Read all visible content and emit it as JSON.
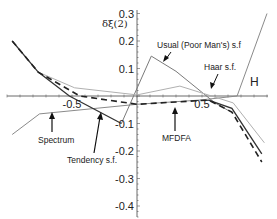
{
  "chart_data": {
    "type": "line",
    "title": "",
    "xlabel": "H",
    "ylabel": "δξ(2)",
    "xlim": [
      -1.0,
      1.0
    ],
    "ylim": [
      -0.45,
      0.3
    ],
    "xticks": [
      -0.5,
      0.5
    ],
    "xtick_labels": [
      "-0.5",
      "0.5"
    ],
    "yticks": [
      0.3,
      0.2,
      0.1,
      -0.1,
      -0.2,
      -0.3,
      -0.4
    ],
    "ytick_labels": [
      "0.3",
      "0.2",
      "0.1",
      "-0.1",
      "-0.2",
      "-0.3",
      "-0.4"
    ],
    "grid": false,
    "series": [
      {
        "name": "Spectrum",
        "style": "solid",
        "color": "#8a8a8a",
        "points": [
          [
            -0.96,
            -0.14
          ],
          [
            -0.75,
            -0.065
          ],
          [
            0.0,
            -0.03
          ],
          [
            0.48,
            -0.015
          ],
          [
            0.77,
            0.0
          ],
          [
            1.0,
            0.3
          ]
        ]
      },
      {
        "name": "Usual (Poor Man's) s.f",
        "style": "solid",
        "color": "#7a7a7a",
        "points": [
          [
            -0.12,
            -0.1
          ],
          [
            0.11,
            0.145
          ],
          [
            0.3,
            0.09
          ],
          [
            0.6,
            -0.025
          ],
          [
            0.73,
            -0.06
          ]
        ]
      },
      {
        "name": "Haar s.f.",
        "style": "solid",
        "color": "#b0b0b0",
        "points": [
          [
            -0.76,
            0.087
          ],
          [
            -0.48,
            0.03
          ],
          [
            0.0,
            0.004
          ],
          [
            0.33,
            0.036
          ],
          [
            0.6,
            -0.004
          ],
          [
            0.74,
            -0.025
          ],
          [
            0.98,
            -0.17
          ]
        ]
      },
      {
        "name": "Tendency s.f.",
        "style": "solid",
        "color": "#333333",
        "points": [
          [
            -0.96,
            0.2
          ],
          [
            -0.76,
            0.087
          ],
          [
            -0.52,
            0.0
          ],
          [
            -0.12,
            -0.1
          ],
          null,
          [
            0.55,
            -0.015
          ],
          [
            0.73,
            -0.045
          ],
          [
            0.96,
            -0.21
          ]
        ]
      },
      {
        "name": "MFDFA",
        "style": "dashed",
        "color": "#222222",
        "points": [
          [
            -0.96,
            0.2
          ],
          [
            -0.76,
            0.087
          ],
          [
            -0.44,
            0.0
          ],
          [
            0.0,
            -0.03
          ],
          [
            0.55,
            -0.015
          ],
          [
            0.73,
            -0.058
          ],
          [
            0.96,
            -0.24
          ]
        ]
      }
    ],
    "annotations": [
      {
        "text": "Usual (Poor Man's) s.f",
        "target": "Usual (Poor Man's) s.f"
      },
      {
        "text": "Haar s.f.",
        "target": "Haar s.f."
      },
      {
        "text": "Spectrum",
        "target": "Spectrum"
      },
      {
        "text": "Tendency s.f.",
        "target": "Tendency s.f."
      },
      {
        "text": "MFDFA",
        "target": "MFDFA"
      }
    ]
  }
}
